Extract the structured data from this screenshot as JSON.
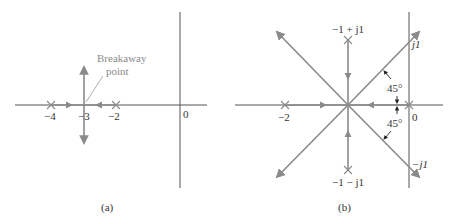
{
  "figure": {
    "type": "root-locus-diagrams",
    "colors": {
      "axis": "#555555",
      "locus": "#8a8a8a",
      "text": "#333333",
      "dimension": "#222222"
    }
  },
  "panel_a": {
    "caption": "(a)",
    "annotation": "Breakaway point",
    "annotation_line1": "Breakaway",
    "annotation_line2": "point",
    "axis_labels": {
      "p4": "−4",
      "p3": "−3",
      "p2": "−2",
      "origin": "0"
    },
    "poles": [
      {
        "re": -4,
        "im": 0
      },
      {
        "re": -2,
        "im": 0
      }
    ],
    "breakaway": {
      "re": -3,
      "im": 0
    }
  },
  "panel_b": {
    "caption": "(b)",
    "axis_labels": {
      "m2": "−2",
      "origin": "0",
      "j1": "j1",
      "mj1": "−j1"
    },
    "pole_labels": {
      "upper": "−1 + j1",
      "lower": "−1 − j1"
    },
    "angle_labels": {
      "upper": "45°",
      "lower": "45°"
    },
    "poles": [
      {
        "re": -2,
        "im": 0
      },
      {
        "re": 0,
        "im": 0
      },
      {
        "re": -1,
        "im": 1
      },
      {
        "re": -1,
        "im": -1
      }
    ],
    "asymptote_center": {
      "re": -1,
      "im": 0
    },
    "asymptote_angles_deg": [
      45,
      135,
      225,
      315
    ]
  }
}
